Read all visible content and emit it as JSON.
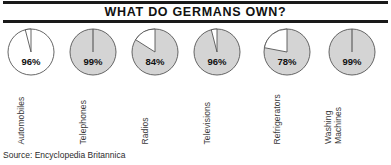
{
  "title": "WHAT DO GERMANS OWN?",
  "source": "Source: Encyclopedia Britannica",
  "chart_data": {
    "type": "pie",
    "title": "WHAT DO GERMANS OWN?",
    "subtitle": "",
    "xlabel": "",
    "ylabel": "",
    "legend": "none",
    "grid": false,
    "note": "Each pie shows the percentage of German households owning the item; the filled wedge is the ownership share and the white wedge is the remainder.",
    "unit": "%",
    "categories": [
      "Automobiles",
      "Telephones",
      "Radios",
      "Televisions",
      "Refrigerators",
      "Washing Machines"
    ],
    "values": [
      96,
      99,
      84,
      96,
      78,
      99
    ],
    "remainders": [
      4,
      1,
      16,
      4,
      22,
      1
    ],
    "value_labels": [
      "96%",
      "99%",
      "84%",
      "96%",
      "78%",
      "99%"
    ],
    "series": [
      {
        "name": "Percent of households owning",
        "values": [
          96,
          99,
          84,
          96,
          78,
          99
        ]
      }
    ],
    "slices": [
      {
        "category": "Automobiles",
        "label": "96%",
        "owned_pct": 96,
        "not_owned_pct": 4,
        "fill": "#ffffff",
        "remainder_fill": "#ffffff"
      },
      {
        "category": "Telephones",
        "label": "99%",
        "owned_pct": 99,
        "not_owned_pct": 1,
        "fill": "#d4d4d4",
        "remainder_fill": "#ffffff"
      },
      {
        "category": "Radios",
        "label": "84%",
        "owned_pct": 84,
        "not_owned_pct": 16,
        "fill": "#d4d4d4",
        "remainder_fill": "#ffffff"
      },
      {
        "category": "Televisions",
        "label": "96%",
        "owned_pct": 96,
        "not_owned_pct": 4,
        "fill": "#d4d4d4",
        "remainder_fill": "#ffffff"
      },
      {
        "category": "Refrigerators",
        "label": "78%",
        "owned_pct": 78,
        "not_owned_pct": 22,
        "fill": "#d4d4d4",
        "remainder_fill": "#ffffff"
      },
      {
        "category": "Washing Machines",
        "label": "99%",
        "owned_pct": 99,
        "not_owned_pct": 1,
        "fill": "#d4d4d4",
        "remainder_fill": "#ffffff"
      }
    ]
  },
  "category_lines": [
    [
      "Automobiles"
    ],
    [
      "Telephones"
    ],
    [
      "Radios"
    ],
    [
      "Televisions"
    ],
    [
      "Refrigerators"
    ],
    [
      "Washing",
      "Machines"
    ]
  ],
  "colors": {
    "pie_fill_gray": "#d4d4d4",
    "pie_fill_white": "#ffffff",
    "pie_stroke": "#555555",
    "rule": "#1a1a1a",
    "title_text": "#111111",
    "label_text": "#3a3a3a"
  }
}
